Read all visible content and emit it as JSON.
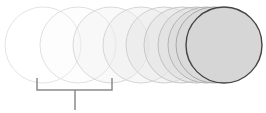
{
  "diagram": {
    "circles": [
      {
        "cx": 43,
        "fill": "#ffffff",
        "fillOpacity": 0,
        "stroke": "#e4e4e4"
      },
      {
        "cx": 78,
        "fill": "#f4f4f4",
        "fillOpacity": 0.2,
        "stroke": "#e0e0e0"
      },
      {
        "cx": 111,
        "fill": "#eeeeee",
        "fillOpacity": 0.35,
        "stroke": "#dadada"
      },
      {
        "cx": 141,
        "fill": "#eaeaea",
        "fillOpacity": 0.4,
        "stroke": "#d6d6d6"
      },
      {
        "cx": 164,
        "fill": "#e6e6e6",
        "fillOpacity": 0.45,
        "stroke": "#d0d0d0"
      },
      {
        "cx": 182,
        "fill": "#e2e2e2",
        "fillOpacity": 0.5,
        "stroke": "#c8c8c8"
      },
      {
        "cx": 196,
        "fill": "#dedede",
        "fillOpacity": 0.55,
        "stroke": "#c0c0c0"
      },
      {
        "cx": 206,
        "fill": "#dadada",
        "fillOpacity": 0.6,
        "stroke": "#b4b4b4"
      },
      {
        "cx": 214,
        "fill": "#d8d8d8",
        "fillOpacity": 0.7,
        "stroke": "#a8a8a8"
      },
      {
        "cx": 224,
        "fill": "#d6d6d6",
        "fillOpacity": 1,
        "stroke": "#444444"
      }
    ],
    "radius": 38,
    "cy": 45,
    "bracket": {
      "x1": 37,
      "x2": 112,
      "top": 78,
      "bar": 90,
      "stemX": 75,
      "stemBottom": 110,
      "color": "#8a8a8a"
    }
  }
}
